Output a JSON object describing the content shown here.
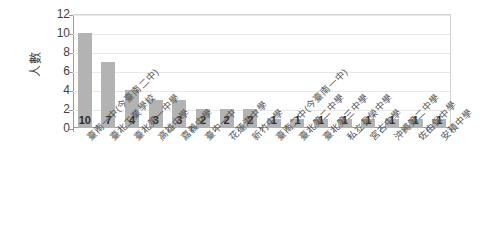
{
  "chart_data": {
    "type": "bar",
    "title": "",
    "subtitle": "",
    "xlabel": "",
    "ylabel": "人數",
    "ylim": [
      0,
      12
    ],
    "yticks": [
      0,
      2,
      4,
      6,
      8,
      10,
      12
    ],
    "grid": true,
    "legend": false,
    "bar_color": "#b3b3b3",
    "categories": [
      "臺南一中(今臺南二中)",
      "臺北工業學校",
      "臺北第一中學",
      "高雄中學",
      "嘉義中學",
      "臺中一中",
      "花蓮港中學",
      "新竹中學",
      "臺南二中(今臺南一中)",
      "臺北第二中學",
      "臺北第三中學",
      "私立長榮中學",
      "宮古中學",
      "沖繩第二中學",
      "佐由保中學",
      "安積中學"
    ],
    "values": [
      10,
      7,
      4,
      3,
      3,
      2,
      2,
      2,
      1,
      1,
      1,
      1,
      1,
      1,
      1,
      1
    ],
    "data_labels": [
      "10",
      "7",
      "4",
      "3",
      "3",
      "2",
      "2",
      "2",
      "1",
      "1",
      "1",
      "1",
      "1",
      "1",
      "1",
      "1"
    ]
  },
  "axes": {
    "y_tick_labels": [
      "12",
      "10",
      "8",
      "6",
      "4",
      "2",
      "0"
    ],
    "y_axis_title": "人數"
  }
}
